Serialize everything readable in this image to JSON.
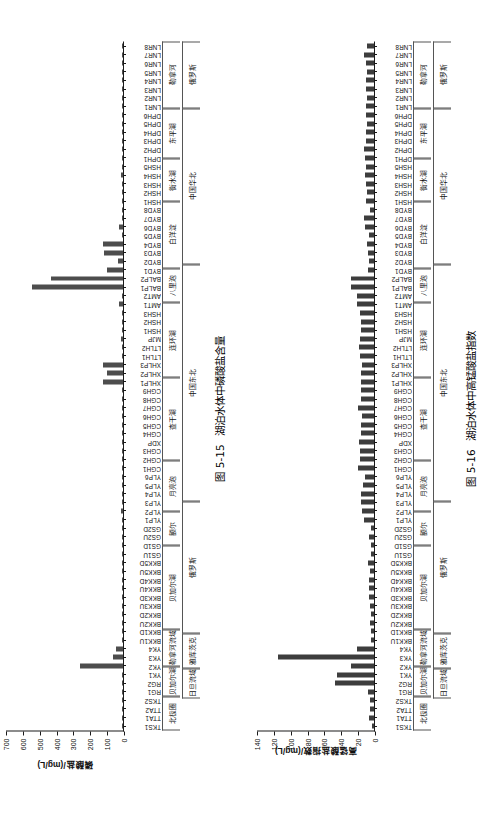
{
  "figures": [
    {
      "id": "fig-5-15",
      "caption_number": "图 5-15",
      "caption_text": "湖泊水体中磷酸盐含量",
      "chart_data": {
        "type": "bar",
        "orientation": "vertical-bars-rotated",
        "title": "湖泊水体中磷酸盐含量",
        "xlabel": "",
        "ylabel": "磷酸盐/(mg/L)",
        "ylim": [
          0,
          700
        ],
        "yticks": [
          0,
          100,
          200,
          300,
          400,
          500,
          600,
          700
        ],
        "grid": false,
        "legend": "none",
        "bar_color": "#4d4d4d",
        "categories": [
          "TKS1",
          "TTA1",
          "TTA2",
          "TKS2",
          "RG1",
          "RG2",
          "YK1",
          "YK2",
          "YK3",
          "YK4",
          "BKK1U",
          "BKK1D",
          "BKK2U",
          "BKK2D",
          "BKK3U",
          "BKK3D",
          "BKK4U",
          "BKK4D",
          "BKK5U",
          "BKK5D",
          "GS1U",
          "GS1D",
          "GS2U",
          "GS2D",
          "YLP1",
          "YLP2",
          "YLP3",
          "YLP4",
          "YLP5",
          "YLP6",
          "CGH1",
          "CGH2",
          "CGH3",
          "XDP",
          "CGH4",
          "CGH5",
          "CGH6",
          "CGH7",
          "CGH8",
          "CGH9",
          "XHLP1",
          "XHLP2",
          "XHLP3",
          "LTLH1",
          "LTLH2",
          "MJP",
          "HSH1",
          "HSH2",
          "HSH3",
          "AMT1",
          "AMT2",
          "BALP1",
          "BALP2",
          "BYD1",
          "BYD2",
          "BYD3",
          "BYD4",
          "BYD5",
          "BYD6",
          "BYD7",
          "BYD8",
          "HSH1",
          "HSH2",
          "HSH3",
          "HSH4",
          "HSH5",
          "DPH1",
          "DPH2",
          "DPH3",
          "DPH4",
          "DPH5",
          "DPH6",
          "LNR1",
          "LNR2",
          "LNR3",
          "LNR4",
          "LNR5",
          "LNR6",
          "LNR7",
          "LNR8"
        ],
        "values": [
          4,
          6,
          5,
          7,
          6,
          5,
          9,
          255,
          62,
          41,
          6,
          5,
          7,
          9,
          5,
          6,
          5,
          4,
          7,
          6,
          5,
          6,
          7,
          6,
          6,
          11,
          5,
          6,
          5,
          4,
          6,
          7,
          6,
          8,
          5,
          6,
          7,
          9,
          8,
          7,
          122,
          93,
          118,
          7,
          8,
          12,
          6,
          5,
          6,
          22,
          9,
          545,
          430,
          95,
          28,
          112,
          118,
          8,
          24,
          5,
          6,
          5,
          8,
          6,
          11,
          5,
          7,
          9,
          6,
          8,
          5,
          7,
          6,
          5,
          7,
          9,
          6,
          5,
          6,
          7
        ],
        "groups_level1": [
          {
            "label": "北极圈",
            "span": 4
          },
          {
            "label": "贝加尔湖",
            "span": 2
          },
          {
            "label": "勒拿河流域",
            "span": 4
          },
          {
            "label": "贝加尔湖",
            "span": 10
          },
          {
            "label": "额尔",
            "span": 4
          },
          {
            "label": "月亮泡",
            "span": 6
          },
          {
            "label": "查干湖",
            "span": 10
          },
          {
            "label": "连环湖",
            "span": 9
          },
          {
            "label": "八里\n泡",
            "span": 4
          },
          {
            "label": "白洋淀",
            "span": 8
          },
          {
            "label": "衡水湖",
            "span": 5
          },
          {
            "label": "东平湖",
            "span": 6
          },
          {
            "label": "勒拿河",
            "span": 8
          }
        ],
        "groups_level2": [
          {
            "label": "",
            "span": 4
          },
          {
            "label": "日旦\n流域",
            "span": 2
          },
          {
            "label": "雅库茨克",
            "span": 4
          },
          {
            "label": "俄罗斯",
            "span": 16
          },
          {
            "label": "中国东北",
            "span": 29
          },
          {
            "label": "中国华北",
            "span": 19
          },
          {
            "label": "俄罗斯",
            "span": 8
          }
        ]
      }
    },
    {
      "id": "fig-5-16",
      "caption_number": "图 5-16",
      "caption_text": "湖泊水体中高锰酸盐指数",
      "chart_data": {
        "type": "bar",
        "orientation": "vertical-bars-rotated",
        "title": "湖泊水体中高锰酸盐指数",
        "xlabel": "",
        "ylabel": "高锰酸盐指数/(mg/L)",
        "ylim": [
          0,
          140
        ],
        "yticks": [
          0,
          20,
          40,
          60,
          80,
          100,
          120,
          140
        ],
        "grid": false,
        "legend": "none",
        "bar_color": "#3d3d3d",
        "categories": [
          "TKS1",
          "TTA1",
          "TTA2",
          "TKS2",
          "RG1",
          "RG2",
          "YK1",
          "YK2",
          "YK3",
          "YK4",
          "BKK1U",
          "BKK1D",
          "BKK2U",
          "BKK2D",
          "BKK3U",
          "BKK3D",
          "BKK4U",
          "BKK4D",
          "BKK5U",
          "BKK5D",
          "GS1U",
          "GS1D",
          "GS2U",
          "GS2D",
          "YLP1",
          "YLP2",
          "YLP3",
          "YLP4",
          "YLP5",
          "YLP6",
          "CGH1",
          "CGH2",
          "CGH3",
          "XDP",
          "CGH4",
          "CGH5",
          "CGH6",
          "CGH7",
          "CGH8",
          "CGH9",
          "XHLP1",
          "XHLP2",
          "XHLP3",
          "LTLH1",
          "LTLH2",
          "MJP",
          "HSH1",
          "HSH2",
          "HSH3",
          "AMT1",
          "AMT2",
          "BALP1",
          "BALP2",
          "BYD1",
          "BYD2",
          "BYD3",
          "BYD4",
          "BYD5",
          "BYD6",
          "BYD7",
          "BYD8",
          "HSH1",
          "HSH2",
          "HSH3",
          "HSH4",
          "HSH5",
          "DPH1",
          "DPH2",
          "DPH3",
          "DPH4",
          "DPH5",
          "DPH6",
          "LNR1",
          "LNR2",
          "LNR3",
          "LNR4",
          "LNR5",
          "LNR6",
          "LNR7",
          "LNR8"
        ],
        "values": [
          3,
          6,
          5,
          5,
          7,
          47,
          44,
          28,
          115,
          20,
          4,
          4,
          5,
          4,
          5,
          6,
          6,
          6,
          5,
          7,
          4,
          4,
          6,
          4,
          12,
          14,
          15,
          15,
          13,
          11,
          19,
          17,
          17,
          18,
          15,
          15,
          14,
          19,
          16,
          15,
          16,
          15,
          14,
          17,
          18,
          17,
          16,
          15,
          17,
          20,
          20,
          28,
          28,
          7,
          6,
          7,
          8,
          6,
          11,
          12,
          5,
          9,
          8,
          10,
          11,
          9,
          11,
          12,
          9,
          10,
          8,
          10,
          9,
          8,
          9,
          9,
          8,
          9,
          12,
          8
        ],
        "groups_level1": [
          {
            "label": "北极圈",
            "span": 4
          },
          {
            "label": "贝加尔湖",
            "span": 2
          },
          {
            "label": "勒拿河流域",
            "span": 4
          },
          {
            "label": "贝加尔湖",
            "span": 10
          },
          {
            "label": "额尔",
            "span": 4
          },
          {
            "label": "月亮泡",
            "span": 6
          },
          {
            "label": "查干湖",
            "span": 10
          },
          {
            "label": "连环湖",
            "span": 9
          },
          {
            "label": "八里\n泡",
            "span": 4
          },
          {
            "label": "白洋淀",
            "span": 8
          },
          {
            "label": "衡水湖",
            "span": 5
          },
          {
            "label": "东平湖",
            "span": 6
          },
          {
            "label": "勒拿河",
            "span": 8
          }
        ],
        "groups_level2": [
          {
            "label": "",
            "span": 4
          },
          {
            "label": "日旦\n流域",
            "span": 2
          },
          {
            "label": "雅库茨克",
            "span": 4
          },
          {
            "label": "俄罗斯",
            "span": 16
          },
          {
            "label": "中国东北",
            "span": 29
          },
          {
            "label": "中国华北",
            "span": 19
          },
          {
            "label": "俄罗斯",
            "span": 8
          }
        ]
      }
    }
  ]
}
